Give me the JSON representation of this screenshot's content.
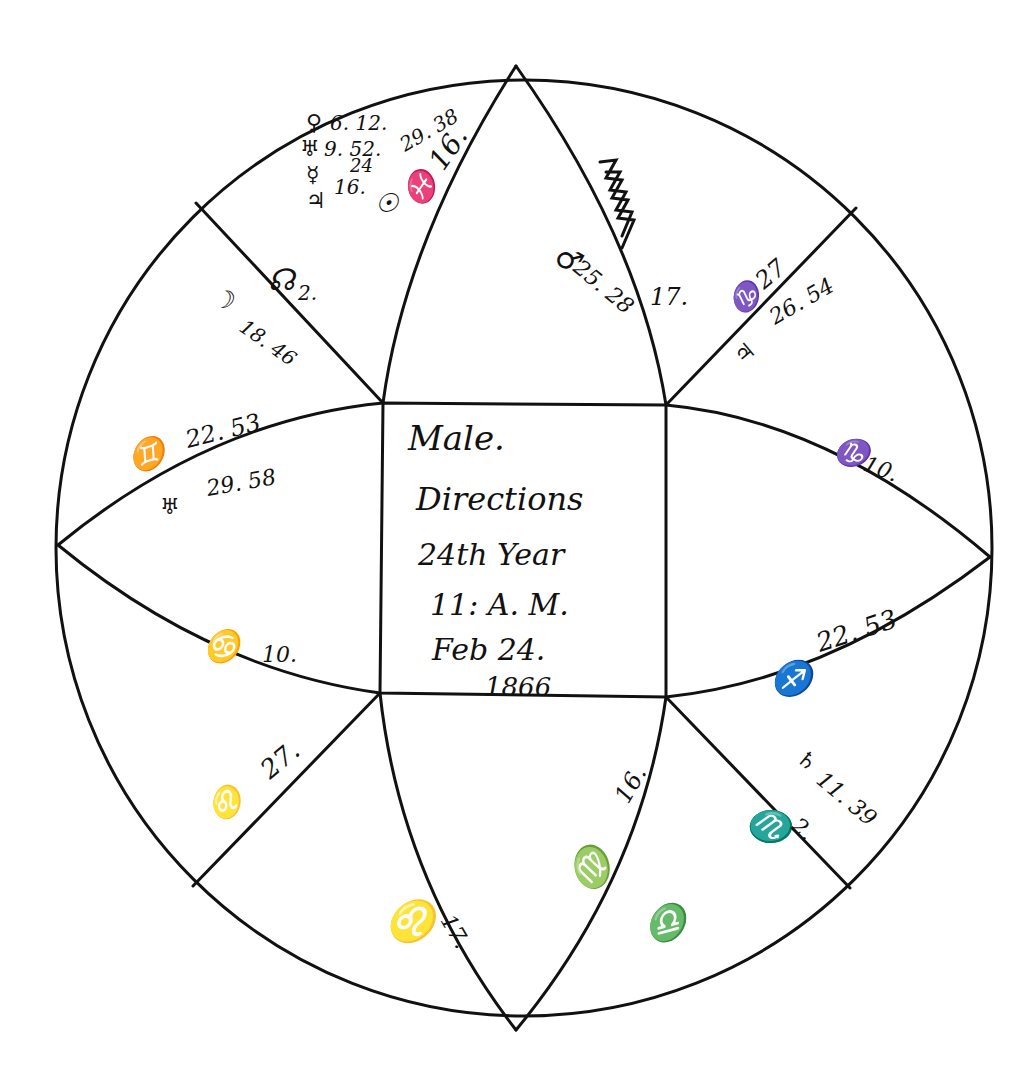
{
  "page": {
    "number_fragment": "",
    "background": "#ffffff",
    "ink_color": "#111111"
  },
  "chart": {
    "type": "horoscope-square-in-circle",
    "center_box": {
      "line1": "Male.",
      "line2": "Directions",
      "line3": "24th Year",
      "line4": "11: A. M.",
      "line5": "Feb 24.",
      "line6": "1866"
    },
    "cusps": {
      "top_left_house": {
        "planets": [
          {
            "glyph": "♀",
            "label": "6. 12."
          },
          {
            "glyph": "♅",
            "label": "9. 52."
          },
          {
            "glyph": "☿",
            "label": "24"
          },
          {
            "glyph": "♃",
            "label": "16."
          }
        ],
        "extra": "29. 38",
        "sun": "☉",
        "pisces_cusp": "♓ 16."
      },
      "node": {
        "glyph": "☊",
        "label": "2."
      },
      "moon": {
        "glyph": "☽",
        "label": "18. 46"
      },
      "gemini_cusp": {
        "glyph": "♊",
        "label": "22. 53"
      },
      "herschel": {
        "glyph": "♅",
        "label": "29. 58"
      },
      "cancer_cusp": {
        "glyph": "♋",
        "label": "10."
      },
      "leo_cusp": {
        "glyph": "♌",
        "label": "27."
      },
      "leo_bottom": {
        "glyph": "♌",
        "label": "17."
      },
      "virgo_cusp": {
        "glyph": "♍",
        "label": "16."
      },
      "libra": {
        "glyph": "♎",
        "label": ""
      },
      "scorpio_cusp": {
        "glyph": "♏",
        "label": "2."
      },
      "saturn": {
        "glyph": "♄",
        "label": "11. 39"
      },
      "sagittarius_cusp": {
        "glyph": "♐",
        "label": "22. 53"
      },
      "capricorn_cusp": {
        "glyph": "♑",
        "label": "10."
      },
      "capricorn_27": {
        "glyph": "♑",
        "label": "27"
      },
      "jupiter": {
        "glyph": "♃",
        "label": "26. 54"
      },
      "aquarius": {
        "glyph": "♒",
        "label": "17."
      },
      "mars": {
        "glyph": "♂",
        "label": "25. 28"
      }
    }
  }
}
